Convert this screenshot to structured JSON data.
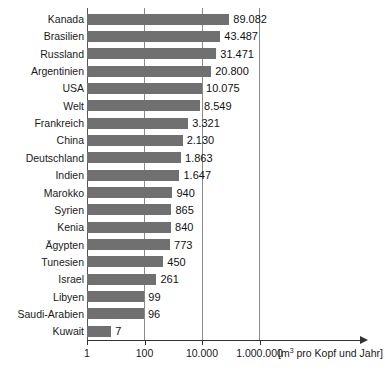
{
  "chart_data": {
    "type": "bar",
    "orientation": "horizontal",
    "title": "",
    "subtitle": "",
    "xlabel": "[m3 pro Kopf und Jahr]",
    "xlabel_prefix": "[m",
    "xlabel_superscript": "3",
    "xlabel_suffix": " pro Kopf und Jahr]",
    "ylabel": "",
    "xscale": "log",
    "xlim": [
      1,
      4000000
    ],
    "xticks": [
      1,
      100,
      10000,
      1000000
    ],
    "xtick_labels": [
      "1",
      "100",
      "10.000",
      "1.000.000"
    ],
    "grid": true,
    "grid_axis": "x",
    "legend": "none",
    "bar_color": "#707070",
    "categories": [
      "Kanada",
      "Brasilien",
      "Russland",
      "Argentinien",
      "USA",
      "Welt",
      "Frankreich",
      "China",
      "Deutschland",
      "Indien",
      "Marokko",
      "Syrien",
      "Kenia",
      "Ägypten",
      "Tunesien",
      "Israel",
      "Libyen",
      "Saudi-Arabien",
      "Kuwait"
    ],
    "values": [
      89082,
      43487,
      31471,
      20800,
      10075,
      8549,
      3321,
      2130,
      1863,
      1647,
      940,
      865,
      840,
      773,
      450,
      261,
      99,
      96,
      7
    ],
    "value_labels": [
      "89.082",
      "43.487",
      "31.471",
      "20.800",
      "10.075",
      "8.549",
      "3.321",
      "2.130",
      "1.863",
      "1.647",
      "940",
      "865",
      "840",
      "773",
      "450",
      "261",
      "99",
      "96",
      "7"
    ]
  }
}
